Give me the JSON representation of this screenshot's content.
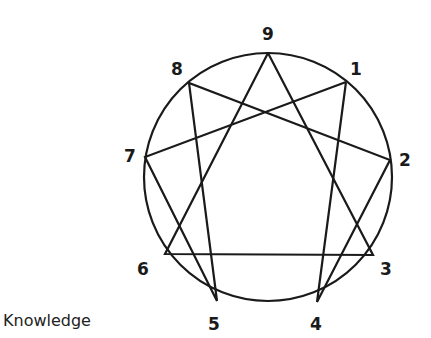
{
  "diagram": {
    "type": "enneagram",
    "caption": "Knowledge",
    "circle": {
      "cx": 268,
      "cy": 177,
      "r": 124
    },
    "points": [
      {
        "label": "9",
        "x": 268,
        "y": 53,
        "lx": 268,
        "ly": 40
      },
      {
        "label": "1",
        "x": 346,
        "y": 82,
        "lx": 356,
        "ly": 75
      },
      {
        "label": "2",
        "x": 390,
        "y": 160,
        "lx": 405,
        "ly": 166
      },
      {
        "label": "3",
        "x": 373,
        "y": 255,
        "lx": 386,
        "ly": 275
      },
      {
        "label": "4",
        "x": 317,
        "y": 302,
        "lx": 316,
        "ly": 330
      },
      {
        "label": "5",
        "x": 217,
        "y": 301,
        "lx": 214,
        "ly": 330
      },
      {
        "label": "6",
        "x": 165,
        "y": 254,
        "lx": 143,
        "ly": 275
      },
      {
        "label": "7",
        "x": 145,
        "y": 157,
        "lx": 130,
        "ly": 162
      },
      {
        "label": "8",
        "x": 189,
        "y": 83,
        "lx": 177,
        "ly": 75
      }
    ],
    "triangle": [
      "9",
      "3",
      "6"
    ],
    "hexad": [
      "1",
      "4",
      "2",
      "8",
      "5",
      "7",
      "1"
    ],
    "colors": {
      "stroke": "#1a1a1a",
      "background": "#ffffff"
    }
  }
}
